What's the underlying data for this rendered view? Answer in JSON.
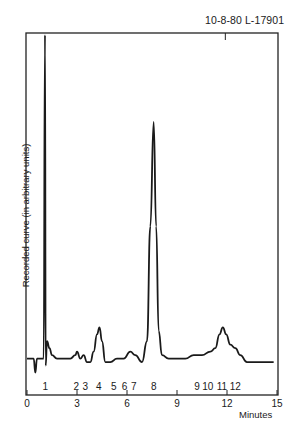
{
  "chart_data": {
    "type": "line",
    "title": "",
    "reference_label": "10-8-80  L-17901",
    "xlabel": "Minutes",
    "ylabel": "Recorded curve (in arbitrary units)",
    "xlim": [
      0,
      15
    ],
    "x_ticks": [
      0,
      3,
      6,
      9,
      12,
      15
    ],
    "grid": false,
    "peak_labels": [
      {
        "label": "1",
        "x": 1.1
      },
      {
        "label": "2",
        "x": 2.95
      },
      {
        "label": "3",
        "x": 3.5
      },
      {
        "label": "4",
        "x": 4.3
      },
      {
        "label": "5",
        "x": 5.2
      },
      {
        "label": "6",
        "x": 5.85
      },
      {
        "label": "7",
        "x": 6.4
      },
      {
        "label": "8",
        "x": 7.6
      },
      {
        "label": "9",
        "x": 10.2
      },
      {
        "label": "10",
        "x": 10.85
      },
      {
        "label": "11",
        "x": 11.7
      },
      {
        "label": "12",
        "x": 12.5
      }
    ],
    "series": [
      {
        "name": "Recorded curve",
        "x": [
          0.0,
          0.4,
          0.5,
          0.6,
          0.8,
          1.0,
          1.08,
          1.12,
          1.2,
          1.35,
          1.5,
          1.8,
          2.2,
          2.6,
          2.9,
          3.0,
          3.2,
          3.4,
          3.6,
          3.8,
          4.0,
          4.2,
          4.35,
          4.5,
          4.7,
          5.0,
          5.4,
          5.8,
          6.2,
          6.5,
          6.9,
          7.2,
          7.4,
          7.6,
          7.75,
          7.9,
          8.1,
          8.5,
          9.0,
          9.5,
          10.0,
          10.5,
          11.0,
          11.3,
          11.55,
          11.75,
          11.95,
          12.2,
          12.5,
          12.8,
          13.2,
          14.0,
          14.8
        ],
        "y": [
          7,
          7,
          3,
          7,
          7,
          7,
          100,
          5,
          12,
          10,
          8,
          7,
          7,
          7,
          8,
          9,
          7,
          8,
          6,
          6,
          9,
          14,
          16,
          12,
          6,
          6,
          7,
          7,
          9,
          8,
          6,
          12,
          45,
          75,
          45,
          15,
          8,
          7,
          7,
          7,
          8,
          8,
          9,
          10,
          14,
          16,
          14,
          11,
          10,
          8,
          6,
          6,
          6
        ]
      }
    ],
    "ylim": [
      0,
      100
    ],
    "yticks_shown": false
  }
}
